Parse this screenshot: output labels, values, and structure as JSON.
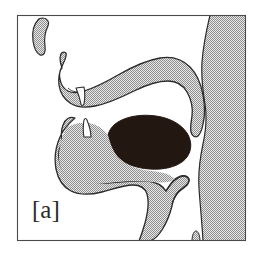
{
  "figure": {
    "kind": "midsagittal-vocal-tract-diagram",
    "caption_label": "[a]",
    "title": "",
    "panel_letter": "a",
    "background_color": "#ffffff",
    "frame": {
      "border_color": "#4a4a4a",
      "x": 17,
      "y": 15,
      "width": 229,
      "height": 226
    },
    "colors": {
      "tissue_stipple_light": "#d9d9d9",
      "tissue_stipple_dark": "#8a8a8a",
      "tissue_outline": "#2b2b2b",
      "tongue_fill": "#231712",
      "tooth_fill": "#ffffff",
      "tooth_outline": "#2b2b2b",
      "label_color": "#2b2b2b"
    },
    "parts": [
      {
        "id": "upper-lip",
        "label": "upper lip",
        "fill": "stipple"
      },
      {
        "id": "upper-jaw-palate",
        "label": "upper jaw and hard palate",
        "fill": "stipple"
      },
      {
        "id": "velum",
        "label": "velum / soft palate",
        "fill": "stipple"
      },
      {
        "id": "upper-incisor",
        "label": "upper incisor",
        "fill": "white"
      },
      {
        "id": "lower-jaw",
        "label": "lower jaw and lower lip",
        "fill": "stipple"
      },
      {
        "id": "lower-incisor",
        "label": "lower incisor",
        "fill": "white"
      },
      {
        "id": "tongue-body",
        "label": "tongue body",
        "fill": "dark"
      },
      {
        "id": "epiglottis",
        "label": "epiglottis",
        "fill": "stipple"
      },
      {
        "id": "pharyngeal-wall",
        "label": "pharyngeal wall",
        "fill": "stipple"
      },
      {
        "id": "larynx-nub",
        "label": "larynx nub",
        "fill": "stipple"
      }
    ]
  }
}
